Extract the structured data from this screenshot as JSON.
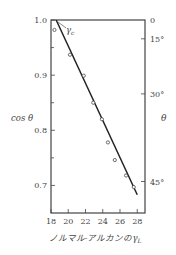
{
  "chart_data": {
    "type": "scatter",
    "title": "",
    "xlabel": "ノルマル-アルカンのγL",
    "ylabel": "cos θ",
    "y2label": "θ",
    "xlim": [
      18,
      28.9
    ],
    "ylim": [
      0.65,
      1.0
    ],
    "x_ticks": [
      18,
      20,
      22,
      24,
      26,
      28
    ],
    "y_ticks": [
      1.0,
      0.9,
      0.8,
      0.7
    ],
    "y_minor_ticks": [
      0.95,
      0.85,
      0.75
    ],
    "y2_ticks": [
      {
        "label": "0",
        "angle_deg": 0
      },
      {
        "label": "15°",
        "angle_deg": 15
      },
      {
        "label": "30°",
        "angle_deg": 30
      },
      {
        "label": "45°",
        "angle_deg": 45
      }
    ],
    "grid": false,
    "legend": null,
    "series": [
      {
        "name": "n-alkanes",
        "marker": "open-circle",
        "points": [
          {
            "x": 18.4,
            "y": 0.982
          },
          {
            "x": 20.2,
            "y": 0.937
          },
          {
            "x": 21.8,
            "y": 0.899
          },
          {
            "x": 22.9,
            "y": 0.85
          },
          {
            "x": 23.9,
            "y": 0.82
          },
          {
            "x": 24.6,
            "y": 0.778
          },
          {
            "x": 25.4,
            "y": 0.746
          },
          {
            "x": 26.7,
            "y": 0.718
          },
          {
            "x": 27.6,
            "y": 0.697
          }
        ]
      },
      {
        "name": "fit",
        "type": "line",
        "points": [
          {
            "x": 18.6,
            "y": 1.0
          },
          {
            "x": 28.0,
            "y": 0.683
          }
        ]
      }
    ],
    "annotations": [
      {
        "text": "γc",
        "x": 18.6,
        "y": 1.0,
        "note": "critical surface tension at cos θ = 1"
      }
    ]
  },
  "labels": {
    "ylabel": "cos θ",
    "y2label": "θ",
    "xlabel_main": "ノルマル-アルカンの",
    "xlabel_sym": "γ",
    "xlabel_sub": "L",
    "gamma_c": "γ",
    "gamma_c_sub": "c"
  }
}
